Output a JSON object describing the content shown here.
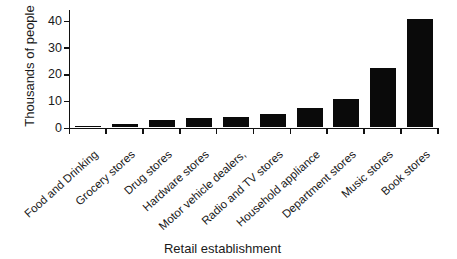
{
  "chart_data": {
    "type": "bar",
    "title": "",
    "xlabel": "Retail establishment",
    "ylabel": "Thousands of people",
    "categories": [
      "Food and Drinking",
      "Grocery stores",
      "Drug stores",
      "Hardware stores",
      "Motor vehicle dealers,",
      "Radio and TV stores",
      "Household appliance",
      "Department stores",
      "Music stores",
      "Book stores"
    ],
    "values": [
      0.5,
      1.2,
      2.8,
      3.5,
      4,
      5.2,
      7.4,
      10.5,
      22.3,
      40.5
    ],
    "yticks": [
      0,
      10,
      20,
      30,
      40
    ],
    "ylim": [
      0,
      44
    ],
    "grid": false,
    "legend": false,
    "bar_color": "#0a0a0a",
    "axis_color": "#111111",
    "text_color": "#1a1a1a"
  }
}
